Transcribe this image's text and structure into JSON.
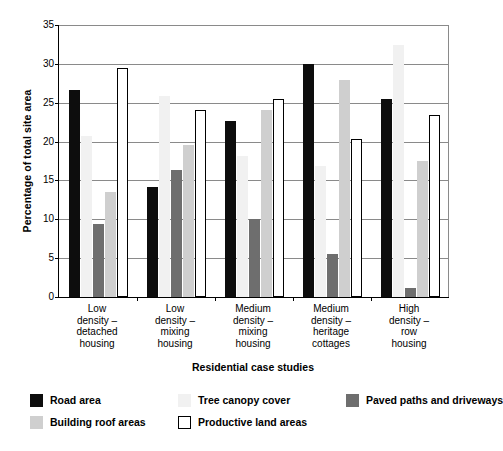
{
  "chart_data": {
    "type": "bar",
    "title": "",
    "xlabel": "Residential case studies",
    "ylabel": "Percentage of total site area",
    "ylim": [
      0,
      35
    ],
    "yticks": [
      0,
      5,
      10,
      15,
      20,
      25,
      30,
      35
    ],
    "ytick_labels": [
      "0",
      "5",
      "10",
      "15",
      "20",
      "25",
      "30",
      "35"
    ],
    "grid": true,
    "legend_position": "bottom",
    "categories": [
      "Low density – detached housing",
      "Low density – mixing housing",
      "Medium density – mixing housing",
      "Medium density – heritage cottages",
      "High density – row housing"
    ],
    "category_lines": [
      [
        "Low",
        "density –",
        "detached",
        "housing"
      ],
      [
        "Low",
        "density –",
        "mixing",
        "housing"
      ],
      [
        "Medium",
        "density –",
        "mixing",
        "housing"
      ],
      [
        "Medium",
        "density –",
        "heritage",
        "cottages"
      ],
      [
        "High",
        "density –",
        "row",
        "housing"
      ]
    ],
    "series": [
      {
        "name": "Road area",
        "key": "road",
        "color": "#0d0d0d",
        "values": [
          26.6,
          14.1,
          22.6,
          30.0,
          25.5
        ]
      },
      {
        "name": "Tree canopy cover",
        "key": "tree",
        "color": "#f1f1f1",
        "values": [
          20.7,
          25.9,
          18.2,
          16.8,
          32.4
        ]
      },
      {
        "name": "Paved paths and driveways",
        "key": "paved",
        "color": "#6e6e6e",
        "values": [
          9.4,
          16.4,
          10.0,
          5.5,
          1.2
        ]
      },
      {
        "name": "Building roof areas",
        "key": "building",
        "color": "#cfcfcf",
        "values": [
          13.5,
          19.5,
          24.1,
          27.9,
          17.5
        ]
      },
      {
        "name": "Productive land areas",
        "key": "productive",
        "color": "#ffffff",
        "values": [
          29.5,
          24.1,
          25.5,
          20.3,
          23.4
        ]
      }
    ]
  },
  "legend": {
    "items": [
      {
        "label": "Road area",
        "swatch": "road"
      },
      {
        "label": "Tree canopy cover",
        "swatch": "tree"
      },
      {
        "label": "Paved paths and driveways",
        "swatch": "paved"
      },
      {
        "label": "Building roof areas",
        "swatch": "building"
      },
      {
        "label": "Productive land areas",
        "swatch": "productive"
      }
    ]
  }
}
